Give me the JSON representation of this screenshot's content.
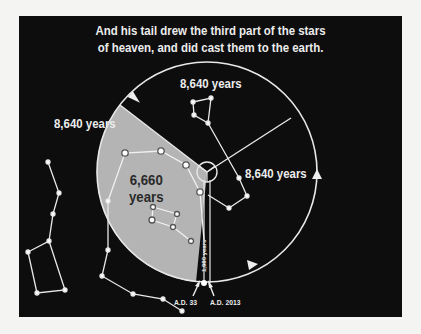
{
  "caption": {
    "line1": "And his tail drew the third part of the stars",
    "line2": "of heaven, and did cast them to the earth."
  },
  "labels": {
    "top": "8,640 years",
    "left": "8,640 years",
    "right": "8,640 years",
    "shaded_line1": "6,660",
    "shaded_line2": "years",
    "gap": "1,980 years",
    "ad33": "A.D. 33",
    "ad2013": "A.D. 2013"
  },
  "colors": {
    "background": "#0d0d0d",
    "page": "#f4f4f2",
    "shaded": "#b4b4b4",
    "line": "#e8e8e8",
    "text_dark": "#2a2a2a"
  }
}
